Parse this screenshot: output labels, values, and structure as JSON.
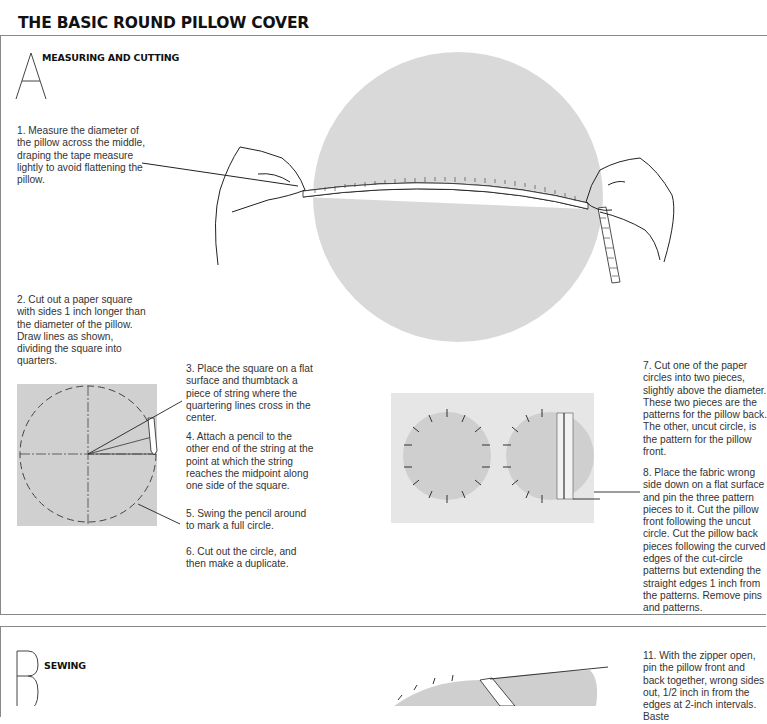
{
  "page": {
    "title": "THE BASIC ROUND PILLOW COVER"
  },
  "sections": [
    {
      "letter": "A",
      "title": "MEASURING AND CUTTING",
      "steps": [
        {
          "number": "1.",
          "text": "1.  Measure the diameter of the pillow across the middle, draping the tape measure lightly to avoid flattening the pillow."
        },
        {
          "number": "2.",
          "text": "2.  Cut out a paper square with sides 1 inch longer than the diameter of the pillow. Draw lines as shown, dividing the square into quarters."
        },
        {
          "number": "3.",
          "text": "3.  Place the square on a flat surface and thumbtack a piece of string where the quartering lines cross in the center."
        },
        {
          "number": "4.",
          "text": "4.  Attach a pencil to the other end of the string at the point at which the string reaches the midpoint along one side of the square."
        },
        {
          "number": "5.",
          "text": "5.  Swing the pencil around to mark a full circle."
        },
        {
          "number": "6.",
          "text": "6.  Cut out the circle, and then make a duplicate."
        },
        {
          "number": "7.",
          "text": "7.  Cut one of the paper circles into two pieces, slightly above the diameter. These two pieces are the patterns for the pillow back. The other, uncut circle, is the pattern for the pillow front."
        },
        {
          "number": "8.",
          "text": "8.  Place the fabric wrong side down on a flat surface and pin the three pattern pieces to it. Cut the pillow front following the uncut circle. Cut the pillow back pieces following the curved edges of the cut-circle patterns but extending the straight edges 1 inch from the patterns. Remove pins and patterns."
        }
      ]
    },
    {
      "letter": "B",
      "title": "SEWING",
      "steps": [
        {
          "number": "11.",
          "text": "11.  With the zipper open, pin the pillow front and back together, wrong sides out, 1/2 inch in from the edges at 2-inch intervals. Baste"
        }
      ]
    }
  ],
  "illustrations": {
    "pillow_measure": "hands-measuring-pillow-with-tape",
    "paper_square": "paper-square-with-quartered-circle",
    "pinned_patterns": "fabric-with-pinned-circle-patterns",
    "sewing_pillow": "pillow-with-pins-and-zipper"
  },
  "colors": {
    "fill_gray": "#d6d6d6",
    "square_gray": "#cfcfcf",
    "fabric_gray": "#e4e4e4",
    "rule": "#888888"
  }
}
